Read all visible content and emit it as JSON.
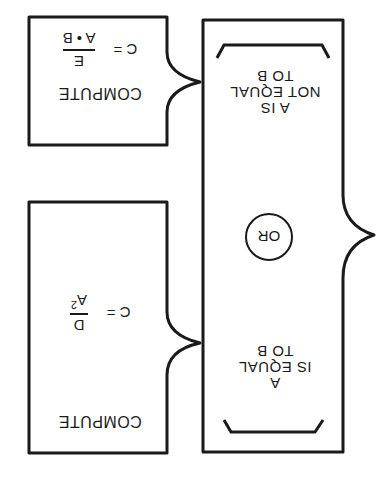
{
  "orientation": "rotated 180 degrees",
  "decision_box": {
    "or_label": "OR",
    "condition_equal": [
      "A",
      "IS EQUAL",
      "TO B"
    ],
    "condition_not_equal": [
      "A IS",
      "NOT EQUAL",
      "TO B"
    ]
  },
  "compute_boxes": [
    {
      "title": "COMPUTE",
      "lhs": "C =",
      "numerator": "D",
      "denominator": "A",
      "denominator_exponent": "2",
      "linked_condition": "A IS EQUAL TO B"
    },
    {
      "title": "COMPUTE",
      "lhs": "C =",
      "numerator": "E",
      "denominator": "A • B",
      "linked_condition": "A IS NOT EQUAL TO B"
    }
  ],
  "colors": {
    "line": "#1a1a1a",
    "background": "#ffffff"
  }
}
